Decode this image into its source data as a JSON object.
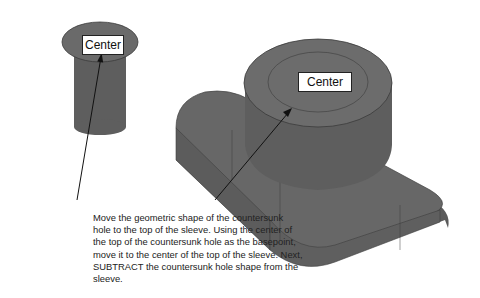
{
  "figure": {
    "colors": {
      "solid_fill": "#666666",
      "solid_dark": "#555555",
      "solid_top": "#6f6f6f",
      "edge": "#3a3a3a",
      "background": "#ffffff"
    },
    "sleeve_label": "Center",
    "base_label": "Center",
    "caption": "Move the geometric shape of the countersunk hole to the top of the sleeve. Using the center of the top of the countersunk hole as the basepoint, move it to the center of the top of the sleeve. Next, SUBTRACT the countersunk hole shape from the sleeve."
  }
}
